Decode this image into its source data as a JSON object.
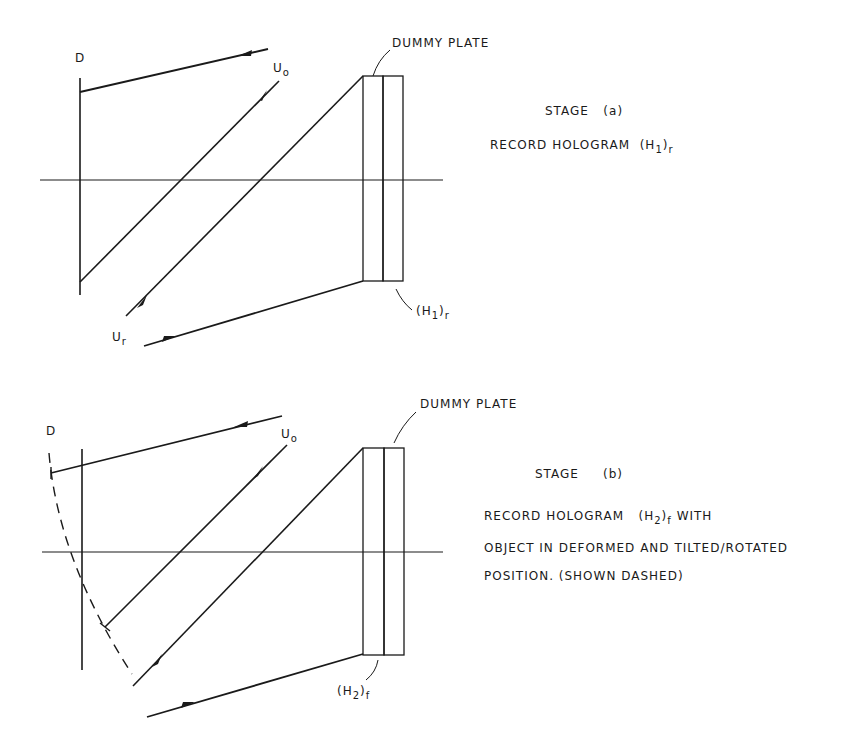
{
  "stage_a": {
    "dummy_plate_label": "DUMMY PLATE",
    "detector_label": "D",
    "object_wave_label": "U",
    "object_wave_sub": "o",
    "reference_wave_label": "U",
    "reference_wave_sub": "r",
    "hologram_label_prefix": "(H",
    "hologram_label_index": "1",
    "hologram_label_close": ")",
    "hologram_label_sub": "r",
    "stage_title": "STAGE",
    "stage_letter": "(a)",
    "caption_prefix": "RECORD HOLOGRAM",
    "caption_holo_prefix": "(H",
    "caption_holo_index": "1",
    "caption_holo_close": ")",
    "caption_holo_sub": "r"
  },
  "stage_b": {
    "dummy_plate_label": "DUMMY PLATE",
    "detector_label": "D",
    "object_wave_label": "U",
    "object_wave_sub": "o",
    "hologram_label_prefix": "(H",
    "hologram_label_index": "2",
    "hologram_label_close": ")",
    "hologram_label_sub": "f",
    "stage_title": "STAGE",
    "stage_letter": "(b)",
    "caption_line1_prefix": "RECORD HOLOGRAM",
    "caption_holo_prefix": "(H",
    "caption_holo_index": "2",
    "caption_holo_close": ")",
    "caption_holo_sub": "f",
    "caption_line1_suffix": "WITH",
    "caption_line2": "OBJECT IN DEFORMED AND TILTED/ROTATED",
    "caption_line3": "POSITION. (SHOWN DASHED)"
  },
  "colors": {
    "ink": "#1a1a1a",
    "background": "#ffffff"
  }
}
